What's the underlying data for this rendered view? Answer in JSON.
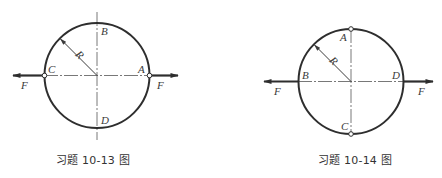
{
  "figures": [
    {
      "caption": "习题 10-13 图",
      "ring": {
        "cx": 97,
        "cy": 75.5,
        "r": 52.5
      },
      "points": {
        "top": "B",
        "bottom": "D",
        "left": "C",
        "right": "A"
      },
      "hinges": [
        "C",
        "A"
      ],
      "forces": [
        {
          "label": "F",
          "direction": "left",
          "applied_at": "C"
        },
        {
          "label": "F",
          "direction": "right",
          "applied_at": "A"
        }
      ],
      "radius_label": "R"
    },
    {
      "caption": "习题 10-14 图",
      "ring": {
        "cx": 351,
        "cy": 81.5,
        "r": 52.5
      },
      "points": {
        "top": "A",
        "bottom": "C",
        "left": "B",
        "right": "D"
      },
      "hinges": [
        "A",
        "C"
      ],
      "forces": [
        {
          "label": "F",
          "direction": "left",
          "applied_at": "B"
        },
        {
          "label": "F",
          "direction": "right",
          "applied_at": "D"
        }
      ],
      "radius_label": "R"
    }
  ],
  "colors": {
    "stroke": "#2e2e2e",
    "axis": "#555555",
    "text": "#333333",
    "background": "#ffffff"
  }
}
